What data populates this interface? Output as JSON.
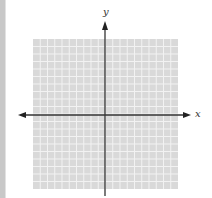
{
  "diagram": {
    "type": "coordinate-plane",
    "grid": {
      "columns": 20,
      "rows": 20,
      "fill": "#d9d9d9",
      "line_color": "#f2f2f2"
    },
    "axes": {
      "x_label": "x",
      "y_label": "y",
      "color": "#333333",
      "x_arrows": "both",
      "y_arrows": "up"
    },
    "left_strip_color": "#c8c8c8"
  }
}
